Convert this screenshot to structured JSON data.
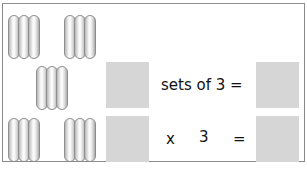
{
  "groups": [
    {
      "id": "group-1",
      "items": 3
    },
    {
      "id": "group-2",
      "items": 3
    },
    {
      "id": "group-3",
      "items": 3
    },
    {
      "id": "group-4",
      "items": 3
    },
    {
      "id": "group-5",
      "items": 3
    }
  ],
  "row1": {
    "label": "sets of 3 ="
  },
  "row2": {
    "times": "x",
    "factor": "3",
    "equals": "="
  },
  "colors": {
    "box": "#d6d6d6",
    "border": "#8a8a8a"
  }
}
